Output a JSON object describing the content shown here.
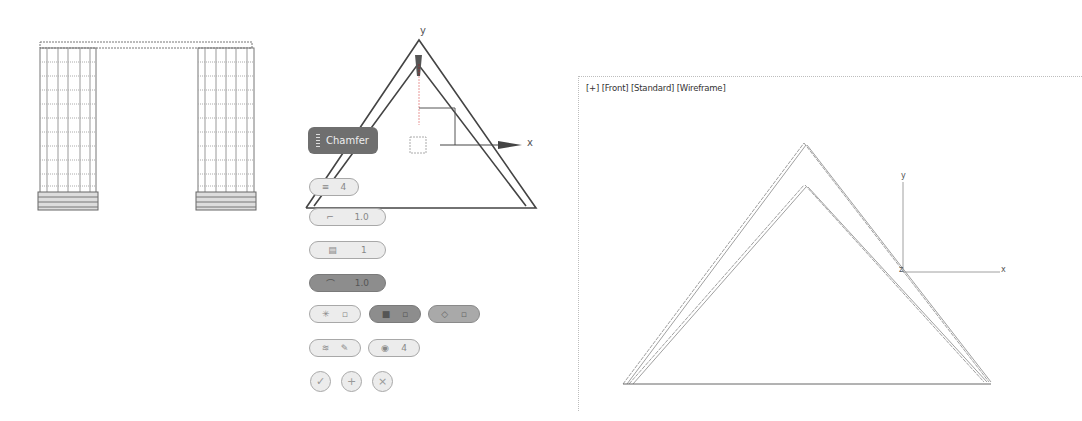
{
  "viewport": {
    "labels": [
      "[+]",
      "[Front]",
      "[Standard]",
      "[Wireframe]"
    ],
    "axis_x": "x",
    "axis_y": "y",
    "axis_z": "z"
  },
  "caddy": {
    "title": "Chamfer",
    "rows": [
      {
        "icon": "edit-poly-icon",
        "value": "4"
      },
      {
        "icon": "amount-icon",
        "value": "1.0"
      },
      {
        "icon": "segments-icon",
        "value": "1"
      },
      {
        "icon": "tension-icon",
        "value": "1.0"
      }
    ],
    "toggle_row_1": [
      {
        "icon": "smooth-icon"
      },
      {
        "icon": "smooth-group-icon"
      },
      {
        "icon": "material-id-icon"
      }
    ],
    "toggle_row_2": [
      {
        "icon": "inset-icon"
      },
      {
        "icon": "mitering-icon",
        "value": "4"
      }
    ],
    "actions": [
      {
        "icon": "ok-icon",
        "glyph": "✓"
      },
      {
        "icon": "apply-icon",
        "glyph": "+"
      },
      {
        "icon": "cancel-icon",
        "glyph": "×"
      }
    ]
  },
  "gizmo": {
    "axis_x": "x",
    "axis_y": "y"
  },
  "colors": {
    "caddy_title_bg": "#6f6f6f",
    "pill_bg": "#ececec",
    "pill_dark": "#8d8d8d",
    "wire": "#555555"
  }
}
